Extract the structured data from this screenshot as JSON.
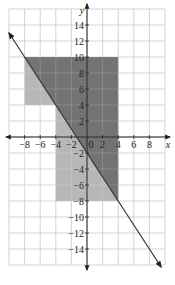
{
  "chart_data": {
    "type": "area",
    "title": "",
    "xlabel": "x",
    "ylabel": "y",
    "xlim": [
      -10,
      10
    ],
    "ylim": [
      -16,
      16
    ],
    "grid": true,
    "grid_step": 2,
    "x_ticks": [
      -8,
      -6,
      -4,
      -2,
      0,
      2,
      4,
      6,
      8
    ],
    "x_tick_labels": [
      "−8",
      "−6",
      "−4",
      "−2",
      "0",
      "2",
      "4",
      "6",
      "8"
    ],
    "y_ticks": [
      14,
      12,
      10,
      8,
      6,
      4,
      2,
      -2,
      -4,
      -6,
      -8,
      -10,
      -12,
      -14
    ],
    "y_tick_labels": [
      "14",
      "12",
      "10",
      "8",
      "6",
      "4",
      "2",
      "−2",
      "−4",
      "−6",
      "−8",
      "−10",
      "−12",
      "−14"
    ],
    "line": {
      "equation": "y = -1.5x - 2",
      "slope": -1.5,
      "intercept": -2,
      "x_range": [
        -10,
        9.5
      ],
      "arrows": "both"
    },
    "regions": [
      {
        "name": "light-region",
        "description": "Union of rectangles: x in [-8,4], y in [4,10] and x in [-4,4], y in [-8,4]",
        "polygons": [
          [
            [
              -8,
              4
            ],
            [
              4,
              4
            ],
            [
              4,
              10
            ],
            [
              -8,
              10
            ]
          ],
          [
            [
              -4,
              -8
            ],
            [
              4,
              -8
            ],
            [
              4,
              4
            ],
            [
              -4,
              4
            ]
          ]
        ],
        "color": "#b3b3b3"
      },
      {
        "name": "dark-region",
        "description": "Part of the shaded region on/above the line y = -1.5x - 2",
        "polygon": [
          [
            -8,
            10
          ],
          [
            4,
            10
          ],
          [
            4,
            -8
          ],
          [
            0,
            -2
          ],
          [
            -4,
            4
          ],
          [
            -4,
            4
          ]
        ],
        "color": "#6f6f6f"
      }
    ],
    "colors": {
      "grid": "#c8c8c8",
      "axis": "#222222",
      "light_shade": "#b3b3b3",
      "dark_shade": "#6f6f6f",
      "line": "#333333"
    }
  }
}
